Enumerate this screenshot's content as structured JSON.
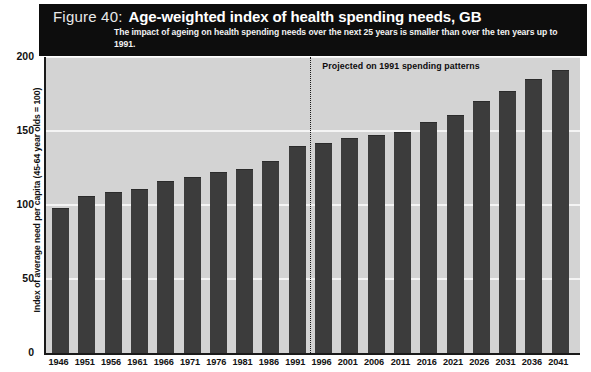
{
  "header": {
    "figure_number": "Figure 40:",
    "title": "Age-weighted index of health spending needs, GB",
    "subtitle": "The impact of ageing on health spending needs over the next 25 years is smaller than over the ten years up to 1991."
  },
  "annotation": {
    "projection_note": "Projected on 1991 spending patterns",
    "divider_after_category": "1991"
  },
  "colors": {
    "header_band": "#0d0d0d",
    "plot_background": "#d3d3d3",
    "bar": "#3c3c3c",
    "gridline": "#f4f4f4",
    "axis": "#1a1a1a",
    "text": "#111111"
  },
  "chart_data": {
    "type": "bar",
    "title": "Age-weighted index of health spending needs, GB",
    "subtitle": "The impact of ageing on health spending needs over the next 25 years is smaller than over the ten years up to 1991.",
    "xlabel": "",
    "ylabel": "Index of average need per capita (45-64 year olds = 100)",
    "ylim": [
      0,
      200
    ],
    "yticks": [
      0,
      50,
      100,
      150,
      200
    ],
    "grid": true,
    "legend": "none",
    "categories": [
      "1946",
      "1951",
      "1956",
      "1961",
      "1966",
      "1971",
      "1976",
      "1981",
      "1986",
      "1991",
      "1996",
      "2001",
      "2006",
      "2011",
      "2016",
      "2021",
      "2026",
      "2031",
      "2036",
      "2041"
    ],
    "values": [
      98,
      106,
      109,
      111,
      116,
      119,
      122,
      124,
      130,
      140,
      142,
      145,
      147,
      149,
      156,
      161,
      170,
      177,
      185,
      191
    ],
    "annotations": [
      {
        "text": "Projected on 1991 spending patterns",
        "type": "vertical-dotted-line",
        "position_after": "1991"
      }
    ]
  }
}
